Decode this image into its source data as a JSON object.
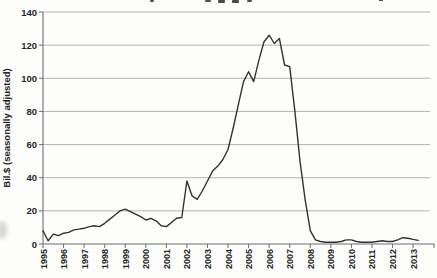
{
  "chart": {
    "background": "#fdfdfc",
    "line_color": "#333333",
    "grid_color": "#ababab",
    "axis_color": "#6f6f6f",
    "label_color": "#262626"
  },
  "chart_data": {
    "type": "line",
    "title": "",
    "xlabel": "",
    "ylabel": "Bil.$ (seasonally adjusted)",
    "ylim": [
      0,
      140
    ],
    "y_tick_labels": [
      "0",
      "20",
      "40",
      "60",
      "80",
      "100",
      "120",
      "140"
    ],
    "x_tick_labels": [
      "1995",
      "1996",
      "1997",
      "1998",
      "1999",
      "2000",
      "2001",
      "2002",
      "2003",
      "2004",
      "2005",
      "2006",
      "2007",
      "2008",
      "2009",
      "2010",
      "2011",
      "2012",
      "2013"
    ],
    "grid": "horizontal",
    "legend": "none",
    "x_start": 1995.0,
    "x_step_years": 0.25,
    "values": [
      8,
      2,
      6,
      5,
      6.5,
      7,
      8.5,
      9,
      9.5,
      10.5,
      11,
      10.5,
      12.5,
      15,
      17.5,
      20,
      21,
      19.5,
      18,
      16.5,
      14.5,
      15.5,
      14,
      11,
      10.5,
      13,
      15.5,
      16,
      38,
      29,
      27,
      32,
      38,
      44,
      47,
      51,
      57,
      70,
      84,
      98,
      104,
      98,
      111,
      122,
      126,
      121,
      124,
      108,
      107,
      80,
      50,
      27,
      8,
      2.5,
      1.5,
      1,
      1,
      1,
      1.5,
      2.5,
      2.5,
      1.5,
      1,
      1,
      1,
      1.5,
      2,
      1.5,
      1.5,
      2.5,
      3.8,
      3.5,
      2.8,
      2.2
    ]
  }
}
